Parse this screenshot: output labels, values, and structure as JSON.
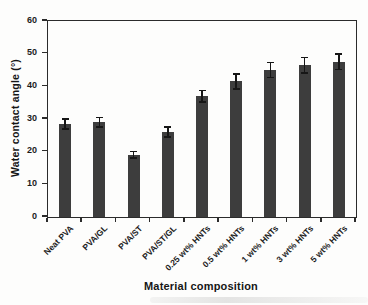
{
  "chart_data": {
    "type": "bar",
    "title": "",
    "xlabel": "Material composition",
    "ylabel": "Water contact angle (°)",
    "categories": [
      "Neat PVA",
      "PVA/GL",
      "PVA/ST",
      "PVA/ST/GL",
      "0.25 wt% HNTs",
      "0.5 wt% HNTs",
      "1 wt% HNTs",
      "3 wt% HNTs",
      "5 wt% HNTs"
    ],
    "values": [
      28.5,
      29,
      19,
      26,
      37,
      41.5,
      45,
      46.5,
      47.5
    ],
    "errors": [
      1.5,
      1.5,
      1.0,
      1.5,
      1.8,
      2.3,
      2.3,
      2.4,
      2.4
    ],
    "ylim": [
      0,
      60
    ],
    "yticks": [
      0,
      10,
      20,
      30,
      40,
      50,
      60
    ],
    "grid": false,
    "legend": null,
    "colors": {
      "bar": "#3d3d3d",
      "error_bar": "#161616",
      "axis": "#2b2b2b",
      "text": "#1c1c1c",
      "background": "#fdfdfc"
    }
  }
}
